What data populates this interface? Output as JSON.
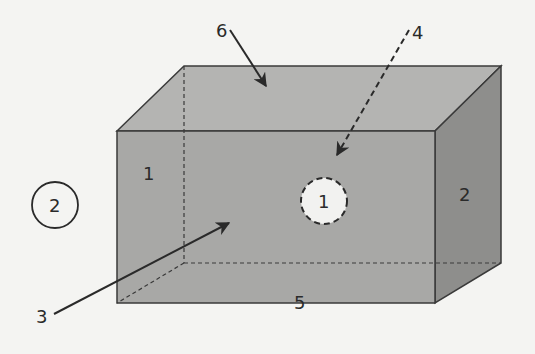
{
  "diagram": {
    "type": "3d-box-diagram",
    "colors": {
      "background": "#f4f4f2",
      "front_face": "#a8a8a6",
      "top_face": "#b4b4b2",
      "right_face": "#8c8c8a",
      "edge": "#3a3a3a",
      "hidden_edge": "#3a3a3a",
      "circle_fill": "#f2f2f0",
      "text": "#2a2a2a"
    },
    "face_labels": {
      "front": "1",
      "right": "2",
      "bottom": "5"
    },
    "callouts": [
      {
        "id": "3",
        "label": "3",
        "style": "solid-arrow",
        "points_to": "interior"
      },
      {
        "id": "4",
        "label": "4",
        "style": "dashed-arrow",
        "points_to": "front-face-marker"
      },
      {
        "id": "6",
        "label": "6",
        "style": "solid-arrow",
        "points_to": "top-face"
      }
    ],
    "markers": [
      {
        "id": "dashed-circle",
        "label": "1",
        "style": "dashed"
      },
      {
        "id": "solid-circle",
        "label": "2",
        "style": "solid"
      }
    ]
  }
}
